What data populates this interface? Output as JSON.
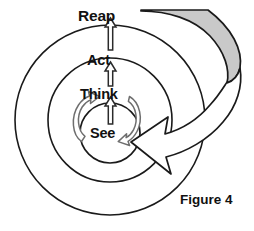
{
  "figure": {
    "caption": "Figure 4",
    "colors": {
      "stroke": "#1a1a1a",
      "band_fill": "#c9c9c9",
      "arrow_fill": "#ffffff",
      "loop_stroke": "#6e6e6e",
      "background": "#ffffff",
      "text": "#111111"
    },
    "rings": [
      {
        "name": "outer-ring",
        "cx": 110,
        "cy": 120,
        "r": 95
      },
      {
        "name": "middle-ring",
        "cx": 110,
        "cy": 120,
        "r": 62
      },
      {
        "name": "inner-ring",
        "cx": 110,
        "cy": 133,
        "r": 30
      }
    ],
    "levels": [
      {
        "id": "reap",
        "label": "Reap"
      },
      {
        "id": "act",
        "label": "Act"
      },
      {
        "id": "think",
        "label": "Think"
      },
      {
        "id": "see",
        "label": "See"
      }
    ],
    "flow_arrows": [
      {
        "name": "see-to-think-arrow",
        "from": "See",
        "to": "Think",
        "direction": "up"
      },
      {
        "name": "think-to-act-arrow",
        "from": "Think",
        "to": "Act",
        "direction": "up"
      },
      {
        "name": "act-to-reap-arrow",
        "from": "Act",
        "to": "Reap",
        "direction": "up"
      }
    ],
    "loop_arrows": [
      {
        "name": "see-think-loop-left",
        "direction": "counter-clockwise-up"
      },
      {
        "name": "see-think-loop-right",
        "direction": "clockwise-down"
      }
    ],
    "sweep_arrow": {
      "name": "big-sweeping-arrow",
      "direction": "inward-left",
      "band_filled": true
    }
  }
}
